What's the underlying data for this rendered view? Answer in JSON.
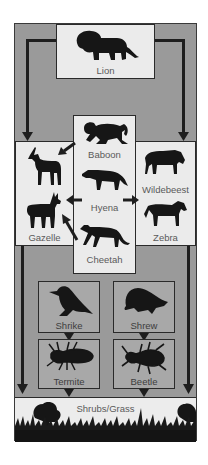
{
  "diagram": {
    "type": "food web",
    "top_predator": {
      "label": "Lion",
      "icon": "lion-icon"
    },
    "predators": [
      {
        "label": "Baboon",
        "icon": "baboon-icon"
      },
      {
        "label": "Hyena",
        "icon": "hyena-icon"
      },
      {
        "label": "Cheetah",
        "icon": "cheetah-icon"
      }
    ],
    "left_prey": [
      {
        "label": "Gazelle",
        "icon": "gazelle-icon"
      }
    ],
    "left_prey_icons": [
      "antelope-icon",
      "gazelle-icon"
    ],
    "right_prey": [
      {
        "label": "Wildebeest",
        "icon": "wildebeest-icon"
      },
      {
        "label": "Zebra",
        "icon": "zebra-icon"
      }
    ],
    "small_consumers": [
      {
        "label": "Shrike",
        "icon": "bird-icon"
      },
      {
        "label": "Shrew",
        "icon": "shrew-icon"
      }
    ],
    "insects": [
      {
        "label": "Termite",
        "icon": "termite-icon"
      },
      {
        "label": "Beetle",
        "icon": "beetle-icon"
      }
    ],
    "producers": {
      "label": "Shrubs/Grass"
    },
    "arrows": [
      {
        "from": "Lion",
        "to": "Gazelle"
      },
      {
        "from": "Lion",
        "to": "Wildebeest"
      },
      {
        "from": "Baboon",
        "to": "Gazelle"
      },
      {
        "from": "Hyena",
        "to": "Gazelle"
      },
      {
        "from": "Hyena",
        "to": "Wildebeest"
      },
      {
        "from": "Cheetah",
        "to": "Gazelle"
      },
      {
        "from": "Gazelle",
        "to": "Shrubs/Grass"
      },
      {
        "from": "Wildebeest",
        "to": "Shrubs/Grass"
      },
      {
        "from": "Shrike",
        "to": "Termite"
      },
      {
        "from": "Shrew",
        "to": "Beetle"
      },
      {
        "from": "Termite",
        "to": "Shrubs/Grass"
      },
      {
        "from": "Beetle",
        "to": "Shrubs/Grass"
      }
    ],
    "colors": {
      "background": "#9a9a9a",
      "box": "#ebebeb",
      "line": "#1e1e1e",
      "text": "#5a5a5a"
    }
  }
}
